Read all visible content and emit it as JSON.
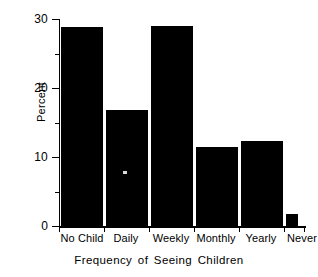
{
  "chart_data": {
    "type": "bar",
    "title": "",
    "xlabel": "Frequency of Seeing Children",
    "ylabel": "Percent",
    "categories": [
      "No Child",
      "Daily",
      "Weekly",
      "Monthly",
      "Yearly",
      "Never"
    ],
    "values": [
      28.8,
      16.8,
      29.0,
      11.5,
      12.3,
      1.8
    ],
    "ylim": [
      0,
      30
    ],
    "yticks": [
      0,
      10,
      20,
      30
    ],
    "ytick_labels": [
      "0",
      "10",
      "20",
      "30"
    ],
    "yminor_ticks": [
      5,
      15,
      25
    ],
    "grid": false,
    "legend": false,
    "bar_color": "#000000",
    "background_color": "#ffffff",
    "axis_color": "#000000"
  },
  "axes": {
    "y_title": "Percent",
    "x_title": "Frequency of Seeing Children"
  }
}
